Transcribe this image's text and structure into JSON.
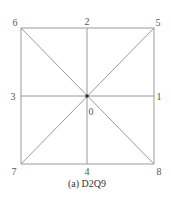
{
  "diagram": {
    "caption": "(a) D2Q9",
    "colors": {
      "line": "#9a9a9a",
      "center_dot": "#333333",
      "label": "#555555"
    },
    "nodes": [
      {
        "id": "0",
        "label": "0",
        "position": "center"
      },
      {
        "id": "1",
        "label": "1",
        "position": "right-middle"
      },
      {
        "id": "2",
        "label": "2",
        "position": "top-middle"
      },
      {
        "id": "3",
        "label": "3",
        "position": "left-middle"
      },
      {
        "id": "4",
        "label": "4",
        "position": "bottom-middle"
      },
      {
        "id": "5",
        "label": "5",
        "position": "top-right"
      },
      {
        "id": "6",
        "label": "6",
        "position": "top-left"
      },
      {
        "id": "7",
        "label": "7",
        "position": "bottom-left"
      },
      {
        "id": "8",
        "label": "8",
        "position": "bottom-right"
      }
    ],
    "edges": [
      {
        "from": "6",
        "to": "5",
        "type": "square-top"
      },
      {
        "from": "5",
        "to": "8",
        "type": "square-right"
      },
      {
        "from": "8",
        "to": "7",
        "type": "square-bottom"
      },
      {
        "from": "7",
        "to": "6",
        "type": "square-left"
      },
      {
        "from": "2",
        "to": "4",
        "type": "vertical-axis"
      },
      {
        "from": "3",
        "to": "1",
        "type": "horizontal-axis"
      },
      {
        "from": "6",
        "to": "8",
        "type": "diagonal"
      },
      {
        "from": "7",
        "to": "5",
        "type": "diagonal"
      }
    ]
  }
}
